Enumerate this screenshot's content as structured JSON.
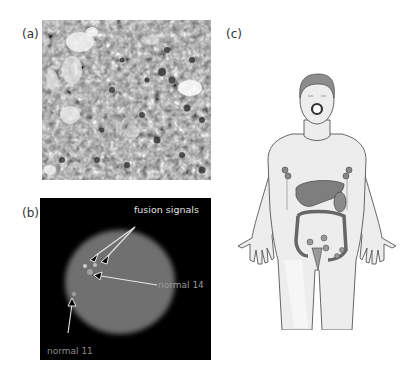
{
  "figure": {
    "panels": [
      {
        "id": "a",
        "label": "(a)",
        "description": "histology micrograph, grayscale cell tissue"
      },
      {
        "id": "b",
        "label": "(b)",
        "description": "FISH nucleus image",
        "annotations": {
          "fusion": "fusion signals",
          "normal14": "normal 14",
          "normal11": "normal 11"
        }
      },
      {
        "id": "c",
        "label": "(c)",
        "description": "human body illustration with highlighted organs and lymph nodes"
      }
    ]
  }
}
